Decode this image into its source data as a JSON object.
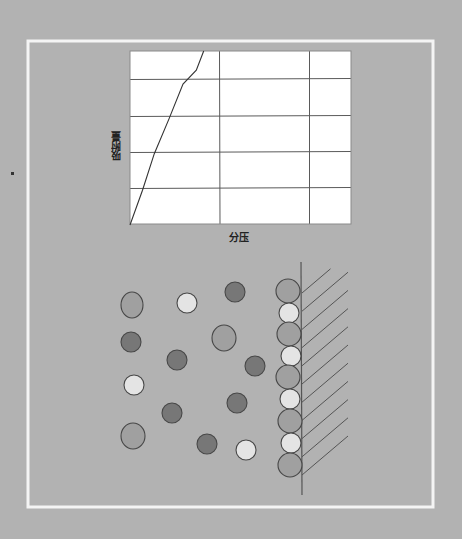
{
  "colors": {
    "background": "#b2b2b2",
    "frame": "#f4f4f4",
    "chart_bg": "#ffffff",
    "grid": "#5a5a5a",
    "curve": "#333333",
    "particle_dark": "#777777",
    "particle_medium": "#a0a0a0",
    "particle_light": "#e4e4e4",
    "particle_stroke": "#474747",
    "wall": "#555555"
  },
  "chart_data": {
    "type": "line",
    "title": "",
    "xlabel": "分压",
    "ylabel": "吸附量",
    "grid": true,
    "x_gridlines": 2,
    "y_gridlines": 4,
    "xlim": [
      0,
      3
    ],
    "ylim": [
      0,
      5
    ],
    "x_tick_labels": [],
    "y_tick_labels": [],
    "series": [
      {
        "name": "adsorption isotherm",
        "x": [
          0,
          0.17,
          0.33,
          0.53,
          0.72,
          0.9,
          1.0
        ],
        "y": [
          0,
          1.0,
          2.05,
          3.05,
          4.05,
          4.45,
          5.0
        ]
      }
    ],
    "legend": null
  },
  "labels": {
    "x_axis": "分压",
    "y_axis": "吸附量"
  },
  "diagram": {
    "free_particles": [
      {
        "type": "medium",
        "cx": 132,
        "cy": 305,
        "rx": 11,
        "ry": 13
      },
      {
        "type": "light",
        "cx": 187,
        "cy": 303,
        "rx": 10,
        "ry": 10
      },
      {
        "type": "dark",
        "cx": 235,
        "cy": 292,
        "rx": 10,
        "ry": 10
      },
      {
        "type": "dark",
        "cx": 131,
        "cy": 342,
        "rx": 10,
        "ry": 10
      },
      {
        "type": "medium",
        "cx": 224,
        "cy": 338,
        "rx": 12,
        "ry": 13
      },
      {
        "type": "dark",
        "cx": 177,
        "cy": 360,
        "rx": 10,
        "ry": 10
      },
      {
        "type": "dark",
        "cx": 255,
        "cy": 366,
        "rx": 10,
        "ry": 10
      },
      {
        "type": "light",
        "cx": 134,
        "cy": 385,
        "rx": 10,
        "ry": 10
      },
      {
        "type": "dark",
        "cx": 237,
        "cy": 403,
        "rx": 10,
        "ry": 10
      },
      {
        "type": "dark",
        "cx": 172,
        "cy": 413,
        "rx": 10,
        "ry": 10
      },
      {
        "type": "medium",
        "cx": 133,
        "cy": 436,
        "rx": 12,
        "ry": 13
      },
      {
        "type": "dark",
        "cx": 207,
        "cy": 444,
        "rx": 10,
        "ry": 10
      },
      {
        "type": "light",
        "cx": 246,
        "cy": 450,
        "rx": 10,
        "ry": 10
      }
    ],
    "adsorbed_particles": [
      {
        "type": "medium",
        "cx": 288,
        "cy": 291,
        "rx": 12,
        "ry": 12
      },
      {
        "type": "light",
        "cx": 289,
        "cy": 313,
        "rx": 10,
        "ry": 10
      },
      {
        "type": "medium",
        "cx": 289,
        "cy": 334,
        "rx": 12,
        "ry": 12
      },
      {
        "type": "light",
        "cx": 291,
        "cy": 356,
        "rx": 10,
        "ry": 10
      },
      {
        "type": "medium",
        "cx": 288,
        "cy": 377,
        "rx": 12,
        "ry": 12
      },
      {
        "type": "light",
        "cx": 290,
        "cy": 399,
        "rx": 10,
        "ry": 10
      },
      {
        "type": "medium",
        "cx": 290,
        "cy": 421,
        "rx": 12,
        "ry": 12
      },
      {
        "type": "light",
        "cx": 291,
        "cy": 443,
        "rx": 10,
        "ry": 10
      },
      {
        "type": "medium",
        "cx": 290,
        "cy": 465,
        "rx": 12,
        "ry": 12
      }
    ],
    "wall": {
      "x": 301,
      "y1": 262,
      "y2": 495
    },
    "hatch_count": 11
  }
}
